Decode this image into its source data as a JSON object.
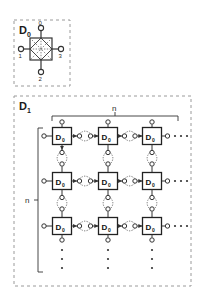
{
  "figure": {
    "background_color": "#ffffff",
    "line_color": "#333333",
    "dashed_border_color": "#9a9a9a",
    "width": 201,
    "height": 293
  },
  "blocks": [
    {
      "id": "D0",
      "label": "D",
      "subscript": "0",
      "frame": {
        "x": 14,
        "y": 20,
        "w": 56,
        "h": 66
      },
      "symbol": {
        "name": "switch-element",
        "x": 30,
        "y": 38,
        "w": 22,
        "h": 22,
        "inner": "diamond-with-dotted-diagonals"
      },
      "ports": [
        {
          "name": "port-0",
          "label": "0",
          "side": "top",
          "cx": 41,
          "cy": 28
        },
        {
          "name": "port-1",
          "label": "1",
          "side": "left",
          "cx": 21,
          "cy": 49
        },
        {
          "name": "port-2",
          "label": "2",
          "side": "bottom",
          "cx": 41,
          "cy": 72
        },
        {
          "name": "port-3",
          "label": "3",
          "side": "right",
          "cx": 61,
          "cy": 49
        }
      ]
    },
    {
      "id": "D1",
      "label": "D",
      "subscript": "1",
      "frame": {
        "x": 14,
        "y": 96,
        "w": 177,
        "h": 190
      },
      "grid": {
        "columns_label": "n",
        "rows_label": "n",
        "visible_columns": 3,
        "visible_rows": 3,
        "cell_label": "D",
        "cell_subscript": "0",
        "column_x": [
          62,
          108,
          152
        ],
        "row_y": [
          136,
          181,
          226
        ],
        "cell_w": 19,
        "cell_h": 17,
        "horizontal_ellipsis_x": [
          168,
          175,
          182
        ],
        "vertical_ellipsis_y": [
          243,
          252,
          261,
          270
        ]
      },
      "brackets": [
        {
          "name": "top-bracket",
          "label": "n",
          "orientation": "horizontal",
          "x1": 52,
          "x2": 178,
          "y": 116
        },
        {
          "name": "left-bracket",
          "label": "n",
          "orientation": "vertical",
          "y1": 128,
          "y2": 272,
          "x": 38
        }
      ]
    }
  ],
  "connectors": {
    "node_radius": 2.3,
    "arc_style": "dotted",
    "description": "adjacent D0 cells joined by pairs of small open nodes with dotted arcs"
  }
}
